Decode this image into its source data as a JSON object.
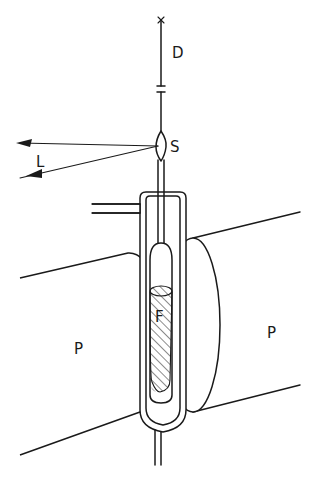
{
  "diagram": {
    "labels": {
      "D": "D",
      "S": "S",
      "L": "L",
      "F": "F",
      "P_left": "P",
      "P_right": "P"
    },
    "colors": {
      "line": "#1a1a1a",
      "background": "#ffffff"
    }
  }
}
